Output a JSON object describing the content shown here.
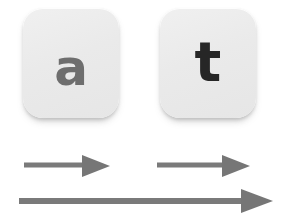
{
  "diagram": {
    "background_color": "#ffffff",
    "keys": [
      {
        "id": "key-a",
        "label": "a",
        "label_color": "#6e6e6e",
        "cap_color": "#eaeaea",
        "name": "keycap-a"
      },
      {
        "id": "key-t",
        "label": "t",
        "label_color": "#262626",
        "cap_color": "#eaeaea",
        "name": "keycap-t"
      }
    ],
    "arrows": [
      {
        "id": "arrow-top-left",
        "direction": "right",
        "color": "#777777",
        "length_px": 85,
        "shaft_thickness_px": 5,
        "name": "arrow-right-short-left"
      },
      {
        "id": "arrow-top-right",
        "direction": "right",
        "color": "#777777",
        "length_px": 92,
        "shaft_thickness_px": 5,
        "name": "arrow-right-short-right"
      },
      {
        "id": "arrow-bottom",
        "direction": "right",
        "color": "#777777",
        "length_px": 253,
        "shaft_thickness_px": 6,
        "name": "arrow-right-long"
      }
    ]
  }
}
